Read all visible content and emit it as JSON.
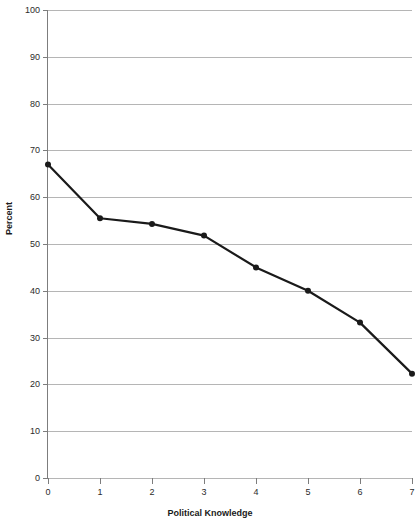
{
  "chart_data": {
    "type": "line",
    "title": "",
    "xlabel": "Political Knowledge",
    "ylabel": "Percent",
    "x": [
      0,
      1,
      2,
      3,
      4,
      5,
      6,
      7
    ],
    "xtick_labels": [
      "0",
      "1",
      "2",
      "3",
      "4",
      "5",
      "6",
      "7"
    ],
    "xlim": [
      0,
      7
    ],
    "ylim": [
      0,
      100
    ],
    "ytick_labels": [
      "0",
      "10",
      "20",
      "30",
      "40",
      "50",
      "60",
      "70",
      "80",
      "90",
      "100"
    ],
    "yticks": [
      0,
      10,
      20,
      30,
      40,
      50,
      60,
      70,
      80,
      90,
      100
    ],
    "grid": "horizontal",
    "legend": "none",
    "series": [
      {
        "name": "Percent",
        "values": [
          67,
          55.5,
          54.3,
          51.8,
          45,
          40,
          33.2,
          22.3
        ],
        "line_color": "#1a1a1a",
        "marker": "circle",
        "marker_color": "#1a1a1a"
      }
    ],
    "colors": {
      "line": "#1a1a1a",
      "grid": "#b5b5b5",
      "axis": "#7d7d7d",
      "text": "#2b2b2b",
      "background": "#ffffff"
    }
  }
}
